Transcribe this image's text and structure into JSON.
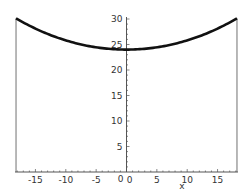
{
  "chart_data": {
    "type": "line",
    "title": "",
    "xlabel": "x",
    "ylabel": "",
    "xlim": [
      -18.2,
      18.2
    ],
    "ylim": [
      0,
      30
    ],
    "grid": false,
    "x_ticks": [
      -15,
      -10,
      -5,
      0,
      5,
      10,
      15
    ],
    "y_ticks": [
      5,
      10,
      15,
      20,
      25,
      30
    ],
    "x_tick_labels": [
      "-15",
      "-10",
      "-5",
      "0",
      "5",
      "10",
      "15"
    ],
    "y_tick_labels": [
      "5",
      "10",
      "15",
      "20",
      "25",
      "30"
    ],
    "origin_label": "0",
    "series": [
      {
        "name": "curve",
        "x": [
          -18.2,
          -15,
          -10,
          -5,
          0,
          5,
          10,
          15,
          18.2
        ],
        "y": [
          30.1,
          28.1,
          25.8,
          24.4,
          24.0,
          24.4,
          25.8,
          28.1,
          30.1
        ]
      }
    ],
    "annotations": [
      "vertical line at x=-18.2 from 0 to 30",
      "vertical line at x=18.2 from 0 to 30"
    ],
    "colors": {
      "curve": "#111111",
      "axis": "#555555",
      "verticals": "#888888"
    }
  }
}
